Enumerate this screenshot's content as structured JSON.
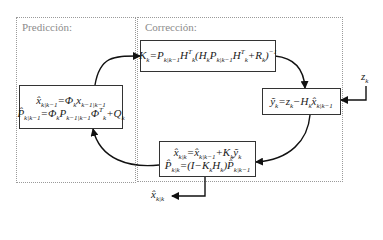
{
  "regions": {
    "prediction": {
      "label": "Predicción:"
    },
    "correction": {
      "label": "Corrección:"
    }
  },
  "boxes": {
    "prediction": {
      "eq1": "x̂ₖ|ₖ₋₁ = Φₖ xₖ₋₁|ₖ₋₁",
      "eq1_parts": {
        "lhs": "x̂",
        "lhs_sub": "k|k−1",
        "op": "=",
        "phi": "Φ",
        "phi_sub": "k",
        "x": "x",
        "x_sub": "k−1|k−1"
      },
      "eq2": "P̂ₖ|ₖ₋₁ = Φₖ Pₖ₋₁|ₖ₋₁ Φₖᵀ + Qₖ",
      "eq2_parts": {
        "lhs": "P̂",
        "lhs_sub": "k|k−1",
        "op": "=",
        "phi": "Φ",
        "phi_sub": "k",
        "p": "P",
        "p_sub": "k−1|k−1",
        "phiT": "Φ",
        "phiT_sup": "T",
        "phiT_sub": "k",
        "plus": "+",
        "q": "Q",
        "q_sub": "k"
      }
    },
    "gain": {
      "eq": "Kₖ = Pₖ|ₖ₋₁ Hₖᵀ (Hₖ Pₖ|ₖ₋₁ Hₖᵀ + Rₖ)⁻¹",
      "parts": {
        "k": "K",
        "k_sub": "k",
        "op": "=",
        "p": "P",
        "p_sub": "k|k−1",
        "h": "H",
        "h_sup": "T",
        "h_sub": "k",
        "open": "(",
        "h2": "H",
        "h2_sub": "k",
        "p2": "P",
        "p2_sub": "k|k−1",
        "h3": "H",
        "h3_sup": "T",
        "h3_sub": "k",
        "plus": "+",
        "r": "R",
        "r_sub": "k",
        "close": ")",
        "inv": "−1"
      }
    },
    "innovation": {
      "eq": "ỹₖ = zₖ − Hₖ x̂ₖ|ₖ₋₁",
      "parts": {
        "y": "ỹ",
        "y_sub": "k",
        "op": "=",
        "z": "z",
        "z_sub": "k",
        "minus": "−",
        "h": "H",
        "h_sub": "k",
        "x": "x̂",
        "x_sub": "k|k−1"
      }
    },
    "update": {
      "eq1": "x̂ₖ|ₖ = x̂ₖ|ₖ₋₁ + Kₖ ỹₖ",
      "eq1_parts": {
        "x": "x̂",
        "x_sub": "k|k",
        "op": "=",
        "x2": "x̂",
        "x2_sub": "k|k−1",
        "plus": "+",
        "k": "K",
        "k_sub": "k",
        "y": "ỹ",
        "y_sub": "k"
      },
      "eq2": "P̂ₖ|ₖ = (I − Kₖ Hₖ) P̂ₖ|ₖ₋₁",
      "eq2_parts": {
        "p": "P̂",
        "p_sub": "k|k",
        "op": "=(I−",
        "k": "K",
        "k_sub": "k",
        "h": "H",
        "h_sub": "k",
        "close": ")",
        "p2": "P̂",
        "p2_sub": "k|k−1"
      }
    }
  },
  "inputs": {
    "measurement": {
      "sym": "z",
      "sub": "k"
    }
  },
  "outputs": {
    "estimate": {
      "sym": "x̂",
      "sub": "k|k"
    }
  }
}
